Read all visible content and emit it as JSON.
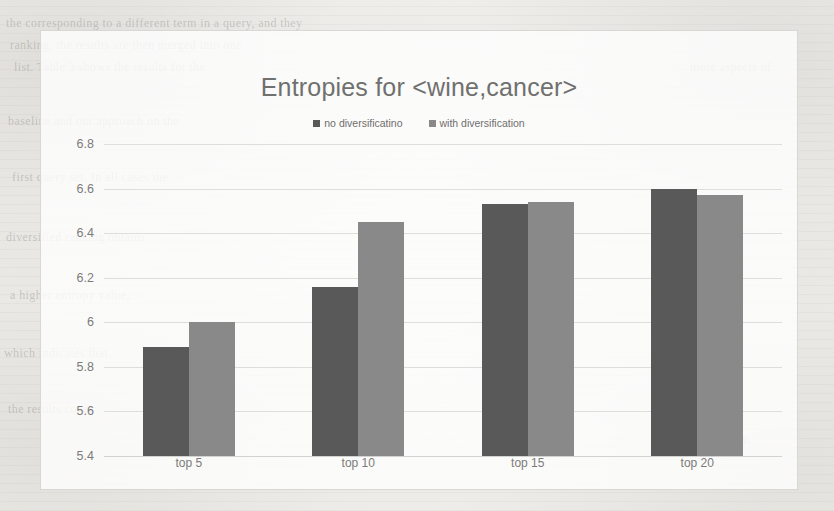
{
  "chart_data": {
    "type": "bar",
    "title": "Entropies for <wine,cancer>",
    "xlabel": "",
    "ylabel": "",
    "categories": [
      "top 5",
      "top 10",
      "top 15",
      "top 20"
    ],
    "series": [
      {
        "name": "no diversificatino",
        "color": "#595959",
        "values": [
          5.89,
          6.16,
          6.53,
          6.6
        ]
      },
      {
        "name": "with diversification",
        "color": "#898989",
        "values": [
          6.0,
          6.45,
          6.54,
          6.57
        ]
      }
    ],
    "ylim": [
      5.4,
      6.8
    ],
    "ytick_step": 0.2,
    "yticks": [
      "6.8",
      "6.6",
      "6.4",
      "6.2",
      "6",
      "5.8",
      "5.6",
      "5.4"
    ],
    "grid": true,
    "legend_position": "top-center"
  },
  "page": {
    "background_color": "#f2f1ee",
    "chart_border_color": "#d8d7d4",
    "title_color": "#70706e",
    "tick_color": "#7c7b79",
    "gridline_color": "#dededc"
  },
  "bleed_through_text": [
    "the corresponding to a different term in a query, and they",
    "ranking. the results are then merged into one",
    "list. Table 3 shows the results for the",
    "baseline and our approach on the",
    "first query set. In all cases the",
    "diversified ranking obtains",
    "a higher entropy value,",
    "which indicates that",
    "the results cover",
    "more aspects of",
    "the query."
  ]
}
